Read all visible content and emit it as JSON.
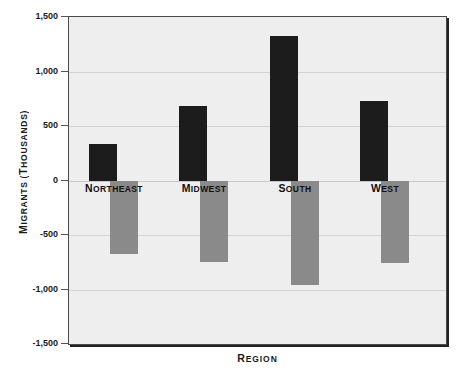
{
  "chart_data": {
    "type": "bar",
    "title": "",
    "subtitle": "",
    "xlabel": "REGION",
    "ylabel": "MIGRANTS (THOUSANDS)",
    "categories": [
      "NORTHEAST",
      "MIDWEST",
      "SOUTH",
      "WEST"
    ],
    "series": [
      {
        "name": "In-migrants",
        "color": "#1c1c1c",
        "values": [
          340,
          690,
          1330,
          735
        ]
      },
      {
        "name": "Out-migrants",
        "color": "#8a8a8a",
        "values": [
          -670,
          -740,
          -950,
          -750
        ]
      }
    ],
    "ylim": [
      -1500,
      1500
    ],
    "ytick_values": [
      1500,
      1000,
      500,
      0,
      -500,
      -1000,
      -1500
    ],
    "ytick_labels": [
      "1,500",
      "1,000",
      "500",
      "0",
      "-500",
      "-1,000",
      "-1,500"
    ],
    "grid": true,
    "legend": "none",
    "plot_background": "#eeeeee",
    "gridline_color": "#d2d2d2",
    "frame_color": "#4a4a4a"
  }
}
